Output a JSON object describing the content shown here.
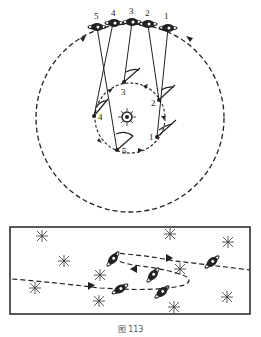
{
  "figure": {
    "caption": "图 113",
    "top_panel": {
      "description": "Planet on outer orbit and Earth on inner orbit around the Sun, with lines of sight",
      "outer_orbit_positions": [
        "1",
        "2",
        "3",
        "4",
        "5"
      ],
      "inner_orbit_positions": [
        "1",
        "2",
        "3",
        "4",
        "5"
      ],
      "center_object": "sun"
    },
    "bottom_panel": {
      "description": "Apparent looping path of the planet against background stars",
      "path_arrows": 3
    },
    "colors": {
      "ink": "#222222",
      "background": "#ffffff"
    }
  }
}
